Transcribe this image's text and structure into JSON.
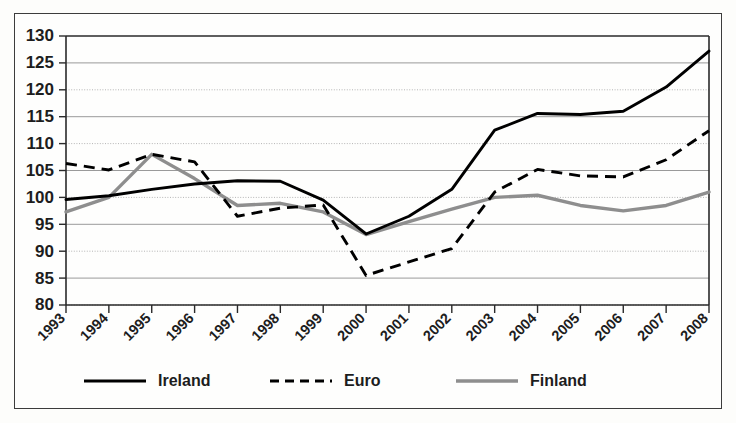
{
  "chart_data": {
    "type": "line",
    "title": "",
    "subtitle": "",
    "xlabel": "",
    "ylabel": "",
    "categories": [
      "1993",
      "1994",
      "1995",
      "1996",
      "1997",
      "1998",
      "1999",
      "2000",
      "2001",
      "2002",
      "2003",
      "2004",
      "2005",
      "2006",
      "2007",
      "2008"
    ],
    "x": [
      1993,
      1994,
      1995,
      1996,
      1997,
      1998,
      1999,
      2000,
      2001,
      2002,
      2003,
      2004,
      2005,
      2006,
      2007,
      2008
    ],
    "series": [
      {
        "name": "Ireland",
        "style": "solid",
        "color": "#000000",
        "values": [
          99.6,
          100.3,
          101.5,
          102.5,
          103.1,
          103.0,
          99.5,
          93.2,
          96.5,
          101.5,
          112.5,
          115.6,
          115.4,
          116.0,
          120.5,
          127.2
        ]
      },
      {
        "name": "Euro",
        "style": "dashed",
        "color": "#000000",
        "values": [
          106.3,
          105.1,
          108.0,
          106.6,
          96.5,
          98.0,
          98.6,
          85.5,
          88.0,
          90.5,
          101.0,
          105.2,
          104.0,
          103.8,
          107.0,
          112.4
        ]
      },
      {
        "name": "Finland",
        "style": "solid-gray",
        "color": "#8e8e8e",
        "values": [
          97.3,
          100.0,
          108.0,
          103.5,
          98.5,
          98.9,
          97.3,
          93.1,
          95.5,
          97.8,
          100.0,
          100.4,
          98.5,
          97.5,
          98.5,
          101.0
        ]
      }
    ],
    "yticks": [
      80,
      85,
      90,
      95,
      100,
      105,
      110,
      115,
      120,
      125,
      130
    ],
    "ylim": [
      80,
      130
    ],
    "xlim": [
      1993,
      2008
    ],
    "grid": true,
    "grid_style_alternating": [
      "solid",
      "dotted"
    ],
    "legend_position": "bottom",
    "legend": [
      {
        "label": "Ireland",
        "style": "solid",
        "color": "#000000"
      },
      {
        "label": "Euro",
        "style": "dashed",
        "color": "#000000"
      },
      {
        "label": "Finland",
        "style": "solid-gray",
        "color": "#8e8e8e"
      }
    ]
  },
  "figure": {
    "border_color": "#3c3c3c",
    "background": "#fefefd"
  }
}
